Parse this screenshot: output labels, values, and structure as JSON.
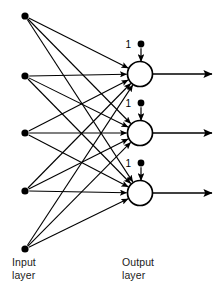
{
  "diagram": {
    "type": "neural-network",
    "colors": {
      "stroke": "#000000",
      "node_fill": "#000000",
      "neuron_fill": "#ffffff",
      "background": "#ffffff",
      "text": "#1a1a1a"
    },
    "labels": {
      "input_layer_line1": "Input",
      "input_layer_line2": "layer",
      "output_layer_line1": "Output",
      "output_layer_line2": "layer"
    },
    "input_nodes": [
      {
        "id": "input-node-1",
        "x": 25,
        "y": 16,
        "r": 3.6
      },
      {
        "id": "input-node-2",
        "x": 25,
        "y": 76,
        "r": 3.6
      },
      {
        "id": "input-node-3",
        "x": 25,
        "y": 133,
        "r": 3.6
      },
      {
        "id": "input-node-4",
        "x": 25,
        "y": 191,
        "r": 3.6
      },
      {
        "id": "input-node-5",
        "x": 25,
        "y": 249,
        "r": 3.6
      }
    ],
    "output_neurons": [
      {
        "id": "output-neuron-1",
        "cx": 140,
        "cy": 74,
        "r": 12.5
      },
      {
        "id": "output-neuron-2",
        "cx": 140,
        "cy": 133,
        "r": 12.5
      },
      {
        "id": "output-neuron-3",
        "cx": 140,
        "cy": 193,
        "r": 12.5
      }
    ],
    "bias_inputs": [
      {
        "id": "bias-1",
        "label": "1",
        "label_x": 131,
        "label_y": 48,
        "dot_x": 141,
        "dot_y": 44,
        "dot_r": 3.4,
        "arrow_to_y": 61.5
      },
      {
        "id": "bias-2",
        "label": "1",
        "label_x": 131,
        "label_y": 107,
        "dot_x": 141,
        "dot_y": 103,
        "dot_r": 3.4,
        "arrow_to_y": 120.5
      },
      {
        "id": "bias-3",
        "label": "1",
        "label_x": 131,
        "label_y": 167,
        "dot_x": 141,
        "dot_y": 163,
        "dot_r": 3.4,
        "arrow_to_y": 180.5
      }
    ],
    "output_arrows": [
      {
        "id": "output-arrow-1",
        "x1": 152.5,
        "y1": 74,
        "x2": 212,
        "y2": 74
      },
      {
        "id": "output-arrow-2",
        "x1": 152.5,
        "y1": 133,
        "x2": 212,
        "y2": 133
      },
      {
        "id": "output-arrow-3",
        "x1": 152.5,
        "y1": 193,
        "x2": 212,
        "y2": 193
      }
    ],
    "connection_count": 15,
    "connections": [
      {
        "from": 1,
        "to": 1
      },
      {
        "from": 1,
        "to": 2
      },
      {
        "from": 1,
        "to": 3
      },
      {
        "from": 2,
        "to": 1
      },
      {
        "from": 2,
        "to": 2
      },
      {
        "from": 2,
        "to": 3
      },
      {
        "from": 3,
        "to": 1
      },
      {
        "from": 3,
        "to": 2
      },
      {
        "from": 3,
        "to": 3
      },
      {
        "from": 4,
        "to": 1
      },
      {
        "from": 4,
        "to": 2
      },
      {
        "from": 4,
        "to": 3
      },
      {
        "from": 5,
        "to": 1
      },
      {
        "from": 5,
        "to": 2
      },
      {
        "from": 5,
        "to": 3
      }
    ]
  }
}
